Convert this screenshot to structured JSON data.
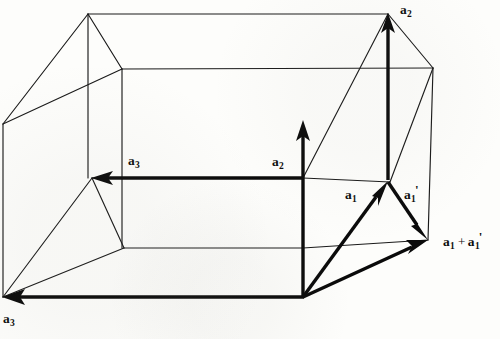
{
  "figure": {
    "kind": "line-drawing",
    "background_color": "#fdfdfb",
    "ink_color": "#0a0a0a",
    "width": 500,
    "height": 339
  },
  "labels": [
    {
      "id": "a2-top",
      "base": "a",
      "sub": "2",
      "prime": "",
      "text": "a2",
      "x": 400,
      "y": 3,
      "name": "label-a2-top"
    },
    {
      "id": "a3-mid",
      "base": "a",
      "sub": "3",
      "prime": "",
      "text": "a3",
      "x": 128,
      "y": 154,
      "name": "label-a3-middle"
    },
    {
      "id": "a2-mid",
      "base": "a",
      "sub": "2",
      "prime": "",
      "text": "a2",
      "x": 272,
      "y": 155,
      "name": "label-a2-middle"
    },
    {
      "id": "a1",
      "base": "a",
      "sub": "1",
      "prime": "",
      "text": "a1",
      "x": 345,
      "y": 188,
      "name": "label-a1"
    },
    {
      "id": "a1-prime",
      "base": "a",
      "sub": "1",
      "prime": "'",
      "text": "a1'",
      "x": 404,
      "y": 183,
      "name": "label-a1-prime"
    },
    {
      "id": "a1-plus-a1p",
      "base": "a",
      "sub": "1",
      "prime": "'",
      "text": "a1 + a1'",
      "x": 443,
      "y": 230,
      "name": "label-a1-plus-a1-prime",
      "compound": true
    },
    {
      "id": "a3-bottom",
      "base": "a",
      "sub": "3",
      "prime": "",
      "text": "a3",
      "x": 3,
      "y": 312,
      "name": "label-a3-bottom"
    }
  ],
  "geometry": {
    "note": "thin edges outline a parallelepiped cell; bold arrows are lattice vectors",
    "vertices": {
      "left_mid": [
        3,
        124
      ],
      "apex_top_left": [
        88,
        14
      ],
      "inner_top": [
        122,
        69
      ],
      "apex_top_right": [
        388,
        14
      ],
      "right_front_top": [
        433,
        68
      ],
      "left_bottom": [
        3,
        297
      ],
      "mid_left": [
        92,
        178
      ],
      "inner_front": [
        124,
        248
      ],
      "bottom_center": [
        303,
        297
      ],
      "bottom_right": [
        428,
        240
      ],
      "mid_right": [
        303,
        178
      ],
      "mid_upper_right": [
        388,
        182
      ]
    },
    "edges": [
      [
        [
          3,
          124
        ],
        [
          88,
          14
        ]
      ],
      [
        [
          88,
          14
        ],
        [
          388,
          14
        ]
      ],
      [
        [
          88,
          14
        ],
        [
          122,
          69
        ]
      ],
      [
        [
          88,
          14
        ],
        [
          88,
          178
        ]
      ],
      [
        [
          3,
          124
        ],
        [
          122,
          69
        ]
      ],
      [
        [
          122,
          69
        ],
        [
          433,
          68
        ]
      ],
      [
        [
          122,
          69
        ],
        [
          122,
          248
        ]
      ],
      [
        [
          388,
          14
        ],
        [
          433,
          68
        ]
      ],
      [
        [
          433,
          68
        ],
        [
          428,
          240
        ]
      ],
      [
        [
          3,
          124
        ],
        [
          3,
          297
        ]
      ],
      [
        [
          3,
          297
        ],
        [
          92,
          178
        ]
      ],
      [
        [
          92,
          178
        ],
        [
          124,
          248
        ]
      ],
      [
        [
          3,
          297
        ],
        [
          124,
          248
        ]
      ],
      [
        [
          124,
          248
        ],
        [
          303,
          248
        ]
      ],
      [
        [
          92,
          178
        ],
        [
          303,
          178
        ]
      ],
      [
        [
          303,
          178
        ],
        [
          388,
          182
        ]
      ],
      [
        [
          303,
          178
        ],
        [
          388,
          14
        ]
      ],
      [
        [
          303,
          248
        ],
        [
          428,
          240
        ]
      ],
      [
        [
          388,
          182
        ],
        [
          433,
          68
        ]
      ]
    ]
  },
  "vectors": [
    {
      "name": "vector-a2-right",
      "label": "a2",
      "from": [
        388,
        180
      ],
      "to": [
        388,
        16
      ],
      "direction": "up"
    },
    {
      "name": "vector-a2-mid",
      "label": "a2",
      "from": [
        303,
        295
      ],
      "to": [
        303,
        122
      ],
      "direction": "up"
    },
    {
      "name": "vector-a3-mid",
      "label": "a3",
      "from": [
        303,
        178
      ],
      "to": [
        94,
        178
      ],
      "direction": "left"
    },
    {
      "name": "vector-a3-bottom",
      "label": "a3",
      "from": [
        303,
        297
      ],
      "to": [
        6,
        297
      ],
      "direction": "left"
    },
    {
      "name": "vector-a1",
      "label": "a1",
      "from": [
        303,
        297
      ],
      "to": [
        386,
        183
      ],
      "direction": "up-right"
    },
    {
      "name": "vector-a1-prime",
      "label": "a1'",
      "from": [
        388,
        182
      ],
      "to": [
        426,
        238
      ],
      "direction": "down-right"
    },
    {
      "name": "vector-sum",
      "label": "a1 + a1'",
      "from": [
        303,
        297
      ],
      "to": [
        426,
        240
      ],
      "direction": "right-up"
    }
  ]
}
